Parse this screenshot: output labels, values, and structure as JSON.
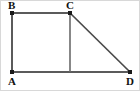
{
  "figure": {
    "type": "geometry-diagram",
    "canvas": {
      "width": 140,
      "height": 91,
      "background": "#ffffff"
    },
    "stroke_color": "#5b5b5b",
    "vertex_color": "#1a1a1a",
    "label_color": "#111111",
    "vertices": [
      {
        "id": "B",
        "label": "B",
        "x": 12,
        "y": 13,
        "label_x": 8,
        "label_y": 0
      },
      {
        "id": "C",
        "label": "C",
        "x": 70,
        "y": 13,
        "label_x": 66,
        "label_y": 0
      },
      {
        "id": "A",
        "label": "A",
        "x": 12,
        "y": 72,
        "label_x": 8,
        "label_y": 76
      },
      {
        "id": "D",
        "label": "D",
        "x": 130,
        "y": 72,
        "label_x": 126,
        "label_y": 76
      },
      {
        "id": "M",
        "label": "",
        "x": 70,
        "y": 72,
        "label_x": 70,
        "label_y": 72
      }
    ],
    "edges": [
      {
        "id": "BC",
        "from": "B",
        "to": "C",
        "x1": 12,
        "y1": 13,
        "x2": 70,
        "y2": 13,
        "kind": "outer"
      },
      {
        "id": "AB",
        "from": "A",
        "to": "B",
        "x1": 12,
        "y1": 13,
        "x2": 12,
        "y2": 72,
        "kind": "outer"
      },
      {
        "id": "AD",
        "from": "A",
        "to": "D",
        "x1": 12,
        "y1": 72,
        "x2": 130,
        "y2": 72,
        "kind": "outer"
      },
      {
        "id": "CD",
        "from": "C",
        "to": "D",
        "x1": 70,
        "y1": 13,
        "x2": 130,
        "y2": 72,
        "kind": "diagonal"
      },
      {
        "id": "CM",
        "from": "C",
        "to": "M",
        "x1": 70,
        "y1": 13,
        "x2": 70,
        "y2": 72,
        "kind": "inner"
      }
    ]
  }
}
